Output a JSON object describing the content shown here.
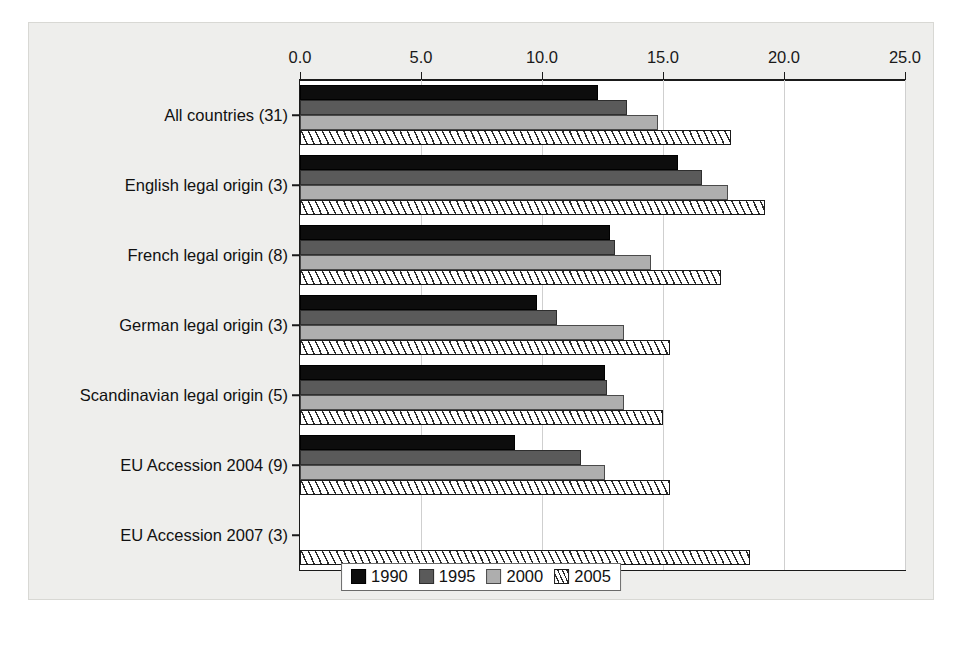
{
  "chart_data": {
    "type": "bar",
    "orientation": "horizontal",
    "title": "",
    "xlabel": "",
    "ylabel": "",
    "xlim": [
      0.0,
      25.0
    ],
    "xticks": [
      "0.0",
      "5.0",
      "10.0",
      "15.0",
      "20.0",
      "25.0"
    ],
    "xtick_values": [
      0,
      5,
      10,
      15,
      20,
      25
    ],
    "grid": "vertical",
    "legend_position": "bottom-center",
    "categories": [
      "All countries (31)",
      "English legal origin (3)",
      "French legal origin (8)",
      "German legal origin (3)",
      "Scandinavian legal origin (5)",
      "EU Accession 2004 (9)",
      "EU Accession 2007 (3)"
    ],
    "series": [
      {
        "name": "1990",
        "color": "#0d0d0d",
        "values": [
          12.3,
          15.6,
          12.8,
          9.8,
          12.6,
          8.9,
          0.0
        ]
      },
      {
        "name": "1995",
        "color": "#5a5a5a",
        "values": [
          13.5,
          16.6,
          13.0,
          10.6,
          12.7,
          11.6,
          0.0
        ]
      },
      {
        "name": "2000",
        "color": "#aeaeae",
        "values": [
          14.8,
          17.7,
          14.5,
          13.4,
          13.4,
          12.6,
          0.0
        ]
      },
      {
        "name": "2005",
        "color": "#ffffff",
        "pattern": "diagonal-hatch",
        "values": [
          17.8,
          19.2,
          17.4,
          15.3,
          15.0,
          15.3,
          18.6
        ]
      }
    ],
    "legend": [
      "1990",
      "1995",
      "2000",
      "2005"
    ]
  }
}
